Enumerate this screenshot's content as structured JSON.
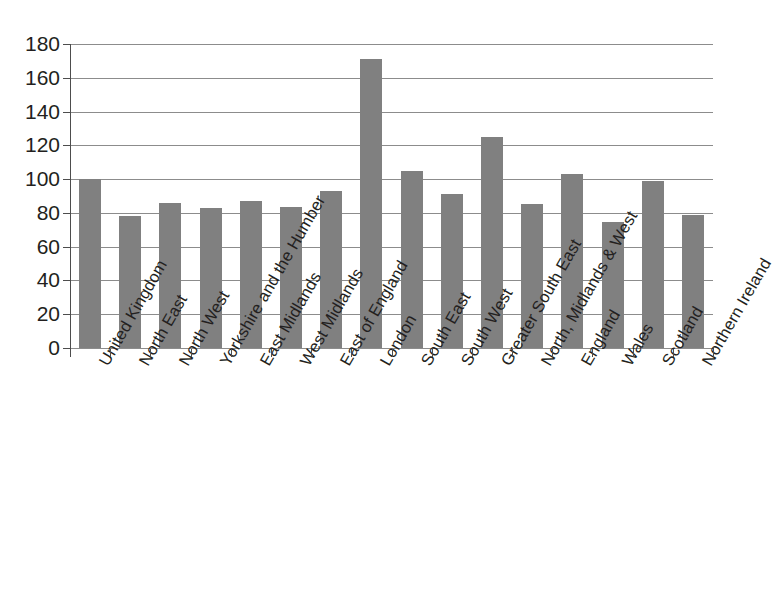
{
  "chart_data": {
    "type": "bar",
    "title": "",
    "xlabel": "",
    "ylabel": "",
    "ylim": [
      0,
      180
    ],
    "ytick_step": 20,
    "yticks": [
      "180",
      "160",
      "140",
      "120",
      "100",
      "80",
      "60",
      "40",
      "20",
      "0"
    ],
    "grid": true,
    "legend": false,
    "bar_color": "#808080",
    "gridline_color": "#8c8c8c",
    "axis_color": "#4d4d4d",
    "categories": [
      "United Kingdom",
      "North East",
      "North West",
      "Yorkshire and the Humber",
      "East Midlands",
      "West Midlands",
      "East of England",
      "London",
      "South East",
      "South West",
      "Greater South East",
      "North, Midlands & West",
      "England",
      "Wales",
      "Scotland",
      "Northern Ireland"
    ],
    "values": [
      100,
      78,
      86,
      83,
      87,
      83.5,
      93,
      171,
      105,
      91,
      125,
      85,
      103,
      74.5,
      99,
      79
    ]
  }
}
